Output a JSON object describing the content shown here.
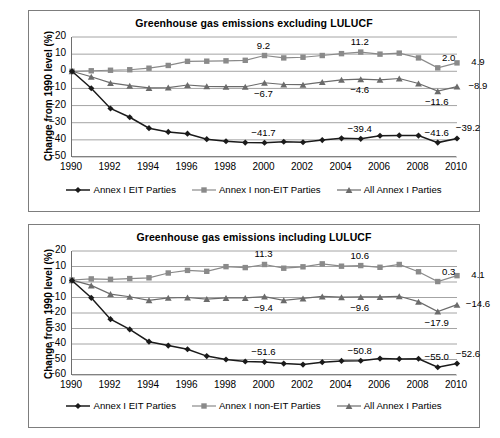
{
  "figure": {
    "ylabel": "Change from 1990 level (%)",
    "legend": [
      {
        "label": "Annex I EIT Parties",
        "marker": "diamond",
        "color": "#1a1a1a"
      },
      {
        "label": "Annex I non-EIT Parties",
        "marker": "square",
        "color": "#8a8a8a"
      },
      {
        "label": "All Annex I Parties",
        "marker": "triangle",
        "color": "#6b6b6b"
      }
    ]
  },
  "chart_data": [
    {
      "type": "line",
      "id": "excluding-lulucf",
      "title": "Greenhouse gas emissions excluding LULUCF",
      "xlabel": "",
      "ylabel": "Change from 1990 level (%)",
      "x": [
        1990,
        1991,
        1992,
        1993,
        1994,
        1995,
        1996,
        1997,
        1998,
        1999,
        2000,
        2001,
        2002,
        2003,
        2004,
        2005,
        2006,
        2007,
        2008,
        2009,
        2010
      ],
      "xticks": [
        1990,
        1992,
        1994,
        1996,
        1998,
        2000,
        2002,
        2004,
        2006,
        2008,
        2010
      ],
      "yticks": [
        20,
        10,
        0,
        -10,
        -20,
        -30,
        -40,
        -50
      ],
      "ylim": [
        -50,
        20
      ],
      "xlim": [
        1990,
        2010
      ],
      "grid": true,
      "legend_position": "bottom",
      "series": [
        {
          "name": "Annex I EIT Parties",
          "marker": "diamond",
          "color": "#1a1a1a",
          "values": [
            0.0,
            -9.9,
            -21.7,
            -26.8,
            -33.2,
            -35.4,
            -36.4,
            -39.6,
            -40.8,
            -41.6,
            -41.7,
            -41.1,
            -41.4,
            -40.1,
            -39.1,
            -39.4,
            -37.6,
            -37.4,
            -37.5,
            -41.6,
            -39.2
          ]
        },
        {
          "name": "Annex I non-EIT Parties",
          "marker": "square",
          "color": "#8a8a8a",
          "values": [
            0.0,
            0.3,
            0.6,
            0.9,
            1.8,
            3.4,
            5.8,
            5.9,
            6.1,
            6.4,
            9.2,
            7.8,
            8.2,
            9.2,
            10.3,
            11.2,
            10.0,
            10.6,
            7.8,
            2.0,
            4.9
          ]
        },
        {
          "name": "All Annex I Parties",
          "marker": "triangle",
          "color": "#6b6b6b",
          "values": [
            0.0,
            -3.2,
            -6.8,
            -8.4,
            -9.7,
            -9.5,
            -8.0,
            -8.8,
            -9.0,
            -9.0,
            -6.7,
            -7.7,
            -7.8,
            -6.3,
            -5.0,
            -4.6,
            -5.0,
            -4.2,
            -7.1,
            -11.6,
            -8.9
          ]
        }
      ],
      "annotations": [
        {
          "text": "9.2",
          "x": 2000,
          "y": 9.2,
          "place": "above",
          "series": "Annex I non-EIT Parties"
        },
        {
          "text": "11.2",
          "x": 2005,
          "y": 11.2,
          "place": "above",
          "series": "Annex I non-EIT Parties"
        },
        {
          "text": "2.0",
          "x": 2009,
          "y": 2.0,
          "place": "above-right",
          "series": "Annex I non-EIT Parties"
        },
        {
          "text": "4.9",
          "x": 2010,
          "y": 4.9,
          "place": "right",
          "series": "Annex I non-EIT Parties"
        },
        {
          "text": "−6.7",
          "x": 2000,
          "y": -6.7,
          "place": "below",
          "series": "All Annex I Parties"
        },
        {
          "text": "−4.6",
          "x": 2005,
          "y": -4.6,
          "place": "below",
          "series": "All Annex I Parties"
        },
        {
          "text": "−11.6",
          "x": 2009,
          "y": -11.6,
          "place": "below",
          "series": "All Annex I Parties"
        },
        {
          "text": "−8.9",
          "x": 2010,
          "y": -8.9,
          "place": "right",
          "series": "All Annex I Parties"
        },
        {
          "text": "−41.7",
          "x": 2000,
          "y": -41.7,
          "place": "above",
          "series": "Annex I EIT Parties"
        },
        {
          "text": "−39.4",
          "x": 2005,
          "y": -39.4,
          "place": "above",
          "series": "Annex I EIT Parties"
        },
        {
          "text": "−41.6",
          "x": 2009,
          "y": -41.6,
          "place": "above",
          "series": "Annex I EIT Parties"
        },
        {
          "text": "−39.2",
          "x": 2010,
          "y": -39.2,
          "place": "above-right",
          "series": "Annex I EIT Parties"
        }
      ]
    },
    {
      "type": "line",
      "id": "including-lulucf",
      "title": "Greenhouse gas emissions including LULUCF",
      "xlabel": "",
      "ylabel": "Change from 1990 level (%)",
      "x": [
        1990,
        1991,
        1992,
        1993,
        1994,
        1995,
        1996,
        1997,
        1998,
        1999,
        2000,
        2001,
        2002,
        2003,
        2004,
        2005,
        2006,
        2007,
        2008,
        2009,
        2010
      ],
      "xticks": [
        1990,
        1992,
        1994,
        1996,
        1998,
        2000,
        2002,
        2004,
        2006,
        2008,
        2010
      ],
      "yticks": [
        20,
        10,
        0,
        -10,
        -20,
        -30,
        -40,
        -50,
        -60
      ],
      "ylim": [
        -60,
        20
      ],
      "xlim": [
        1990,
        2010
      ],
      "grid": true,
      "legend_position": "bottom",
      "series": [
        {
          "name": "Annex I EIT Parties",
          "marker": "diamond",
          "color": "#1a1a1a",
          "values": [
            1.0,
            -10.2,
            -24.0,
            -30.6,
            -38.5,
            -41.0,
            -43.4,
            -47.8,
            -50.0,
            -51.3,
            -51.6,
            -52.6,
            -53.3,
            -51.7,
            -50.9,
            -50.8,
            -49.4,
            -49.6,
            -49.5,
            -55.0,
            -52.6
          ]
        },
        {
          "name": "Annex I non-EIT Parties",
          "marker": "square",
          "color": "#8a8a8a",
          "values": [
            1.3,
            2.0,
            1.7,
            2.2,
            2.7,
            5.8,
            7.5,
            6.9,
            9.9,
            9.3,
            11.3,
            8.9,
            9.8,
            11.7,
            10.2,
            10.6,
            9.5,
            11.3,
            6.6,
            0.3,
            4.1
          ]
        },
        {
          "name": "All Annex I Parties",
          "marker": "triangle",
          "color": "#6b6b6b",
          "values": [
            1.2,
            -2.2,
            -7.8,
            -9.5,
            -11.8,
            -10.2,
            -10.0,
            -11.0,
            -10.3,
            -10.3,
            -9.4,
            -11.8,
            -10.6,
            -9.3,
            -9.8,
            -9.6,
            -9.6,
            -9.2,
            -12.7,
            -19.1,
            -14.6
          ]
        }
      ],
      "annotations": [
        {
          "text": "11.3",
          "x": 2000,
          "y": 11.3,
          "place": "above",
          "series": "Annex I non-EIT Parties"
        },
        {
          "text": "10.6",
          "x": 2005,
          "y": 10.6,
          "place": "above",
          "series": "Annex I non-EIT Parties"
        },
        {
          "text": "0.3",
          "x": 2009,
          "y": 0.3,
          "place": "above-right",
          "series": "Annex I non-EIT Parties"
        },
        {
          "text": "4.1",
          "x": 2010,
          "y": 4.1,
          "place": "right",
          "series": "Annex I non-EIT Parties"
        },
        {
          "text": "−9.4",
          "x": 2000,
          "y": -9.4,
          "place": "below",
          "series": "All Annex I Parties"
        },
        {
          "text": "−9.6",
          "x": 2005,
          "y": -9.6,
          "place": "below",
          "series": "All Annex I Parties"
        },
        {
          "text": "−17.9",
          "x": 2009,
          "y": -19.1,
          "place": "below",
          "series": "All Annex I Parties"
        },
        {
          "text": "−14.6",
          "x": 2010,
          "y": -14.6,
          "place": "right",
          "series": "All Annex I Parties"
        },
        {
          "text": "−51.6",
          "x": 2000,
          "y": -51.6,
          "place": "above",
          "series": "Annex I EIT Parties"
        },
        {
          "text": "−50.8",
          "x": 2005,
          "y": -50.8,
          "place": "above",
          "series": "Annex I EIT Parties"
        },
        {
          "text": "−55.0",
          "x": 2009,
          "y": -55.0,
          "place": "above",
          "series": "Annex I EIT Parties"
        },
        {
          "text": "−52.6",
          "x": 2010,
          "y": -52.6,
          "place": "above-right",
          "series": "Annex I EIT Parties"
        }
      ]
    }
  ]
}
